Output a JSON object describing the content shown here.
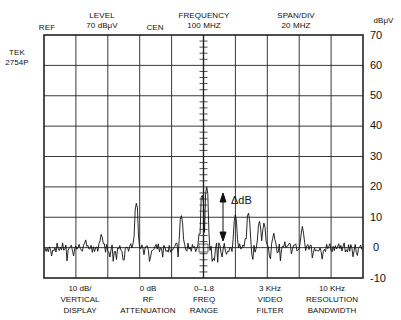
{
  "instrument": {
    "brand": "TEK",
    "model": "2754P"
  },
  "header": {
    "ref": "REF",
    "level_label": "LEVEL",
    "level_value": "70 dBμV",
    "cen": "CEN",
    "frequency_label": "FREQUENCY",
    "frequency_value": "100 MHZ",
    "span_label": "SPAN/DIV",
    "span_value": "20 MHZ",
    "unit": "dBμV"
  },
  "footer": [
    {
      "value": "10 dB/",
      "line2": "VERTICAL",
      "line3": "DISPLAY"
    },
    {
      "value": "0 dB",
      "line2": "RF",
      "line3": "ATTENUATION"
    },
    {
      "value": "0–1.8",
      "line2": "FREQ",
      "line3": "RANGE"
    },
    {
      "value": "3 KHz",
      "line2": "VIDEO",
      "line3": "FILTER"
    },
    {
      "value": "10 KHz",
      "line2": "RESOLUTION",
      "line3": "BANDWIDTH"
    }
  ],
  "annotation": {
    "delta": "ΔdB"
  },
  "chart_data": {
    "type": "line",
    "xlabel": "Frequency (center 100 MHz, 20 MHz/div)",
    "ylabel": "dBμV",
    "ylim": [
      -10,
      70
    ],
    "yticks": [
      70,
      60,
      50,
      40,
      30,
      20,
      10,
      0,
      -10
    ],
    "x_divisions": 10,
    "y_divisions": 8,
    "grid": true,
    "noise_floor_dbuv": 0,
    "peaks": [
      {
        "div": 1.3,
        "level": 3
      },
      {
        "div": 1.8,
        "level": 5
      },
      {
        "div": 2.9,
        "level": 15
      },
      {
        "div": 4.3,
        "level": 11
      },
      {
        "div": 4.95,
        "level": 18
      },
      {
        "div": 5.1,
        "level": 20
      },
      {
        "div": 6.0,
        "level": 11
      },
      {
        "div": 6.4,
        "level": 12
      },
      {
        "div": 6.75,
        "level": 9
      },
      {
        "div": 6.9,
        "level": 8.5
      },
      {
        "div": 7.2,
        "level": 5
      },
      {
        "div": 7.55,
        "level": 2
      },
      {
        "div": 8.1,
        "level": 7
      }
    ]
  }
}
